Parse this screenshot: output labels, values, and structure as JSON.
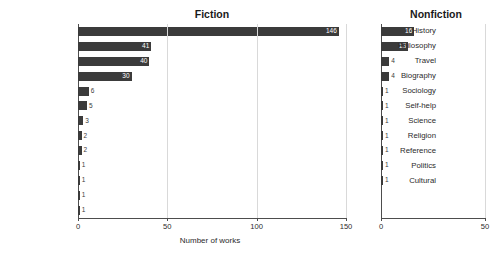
{
  "chart_data": {
    "type": "bar",
    "orientation": "horizontal",
    "title": "",
    "xlabel": "Number of works",
    "ylabel": "",
    "grid": true,
    "legend": false,
    "bar_color": "#3b3b3b",
    "panels": [
      {
        "name": "fiction",
        "title": "Fiction",
        "xlim": [
          0,
          150
        ],
        "xticks": [
          0,
          50,
          100,
          150
        ],
        "xtick_labels": [
          "0",
          "50",
          "100",
          "150"
        ],
        "categories": [
          "Classics",
          "Short-stories",
          "Literature",
          "Romance",
          "Fantasy",
          "Plays",
          "Drama",
          "Sci-fi",
          "Historical",
          "Literary-fiction",
          "Humor",
          "Contemporary",
          "Childrens"
        ],
        "values": [
          146,
          41,
          40,
          30,
          6,
          5,
          3,
          2,
          2,
          1,
          1,
          1,
          1
        ],
        "value_labels": [
          "146",
          "41",
          "40",
          "30",
          "6",
          "5",
          "3",
          "2",
          "2",
          "1",
          "1",
          "1",
          "1"
        ]
      },
      {
        "name": "nonfiction",
        "title": "Nonfiction",
        "xlim": [
          0,
          50
        ],
        "xticks": [
          0,
          50
        ],
        "xtick_labels": [
          "0",
          "50"
        ],
        "categories": [
          "History",
          "Philosophy",
          "Travel",
          "Biography",
          "Sociology",
          "Self-help",
          "Science",
          "Religion",
          "Reference",
          "Politics",
          "Cultural"
        ],
        "values": [
          16,
          13,
          4,
          4,
          1,
          1,
          1,
          1,
          1,
          1,
          1
        ],
        "value_labels": [
          "16",
          "13",
          "4",
          "4",
          "1",
          "1",
          "1",
          "1",
          "1",
          "1",
          "1"
        ]
      }
    ]
  }
}
